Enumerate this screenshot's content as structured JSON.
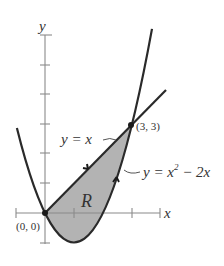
{
  "figure": {
    "type": "region-between-curves",
    "axes": {
      "x_label": "x",
      "y_label": "y",
      "x_ticks": [
        -1,
        1,
        3,
        4
      ],
      "y_ticks": [
        -1,
        1,
        2,
        3,
        4,
        5,
        6
      ]
    },
    "curves": [
      {
        "id": "line",
        "equation_lhs": "y = x",
        "expr": "x"
      },
      {
        "id": "parabola",
        "equation_lhs": "y = x",
        "sup": "2",
        "equation_rhs": " − 2x",
        "expr": "x^2 - 2x"
      }
    ],
    "labels": {
      "line": "y = x",
      "parabola_main": "y = x",
      "parabola_sup": "2",
      "parabola_rest": " − 2x",
      "region": "R",
      "origin_point": "(0, 0)",
      "intersection_point": "(3, 3)",
      "x_axis": "x",
      "y_axis": "y"
    },
    "points": [
      {
        "label": "(0, 0)",
        "x": 0,
        "y": 0
      },
      {
        "label": "(3, 3)",
        "x": 3,
        "y": 3
      }
    ],
    "colors": {
      "curve": "#2a2a2a",
      "axis": "#8a8a8a",
      "region_fill": "#b3b3b3",
      "text": "#333333"
    }
  }
}
